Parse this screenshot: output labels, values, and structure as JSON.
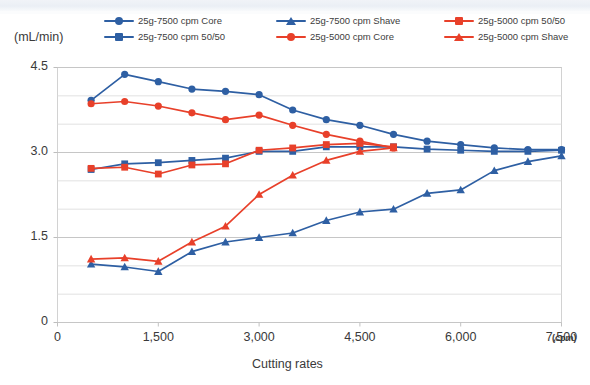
{
  "chart_data": {
    "type": "line",
    "title": "",
    "xlabel": "Cutting rates",
    "xunit": "(cpm)",
    "ylabel": "(mL/min)",
    "xlim": [
      0,
      7500
    ],
    "ylim": [
      0,
      4.5
    ],
    "xticks": [
      "0",
      "1,500",
      "3,000",
      "4,500",
      "6,000",
      "7,500"
    ],
    "xtick_values": [
      0,
      1500,
      3000,
      4500,
      6000,
      7500
    ],
    "yticks": [
      "0",
      "1.5",
      "3.0",
      "4.5"
    ],
    "ytick_values": [
      0,
      1.5,
      3.0,
      4.5
    ],
    "grid": true,
    "grid_minor_step": 0.5,
    "legend_position": "top",
    "colors": {
      "blue": "#2E5FA3",
      "red": "#E8402A",
      "grid": "#d8d8d8",
      "axis": "#c9c9c9"
    },
    "series": [
      {
        "name": "25g-7500 cpm Core",
        "color": "#2E5FA3",
        "marker": "circle",
        "x": [
          500,
          1000,
          1500,
          2000,
          2500,
          3000,
          3500,
          4000,
          4500,
          5000,
          5500,
          6000,
          6500,
          7000,
          7500
        ],
        "values": [
          3.92,
          4.38,
          4.25,
          4.12,
          4.08,
          4.02,
          3.75,
          3.58,
          3.48,
          3.32,
          3.2,
          3.14,
          3.08,
          3.05,
          3.05
        ]
      },
      {
        "name": "25g-7500 cpm 50/50",
        "color": "#2E5FA3",
        "marker": "square",
        "x": [
          500,
          1000,
          1500,
          2000,
          2500,
          3000,
          3500,
          4000,
          4500,
          5000,
          5500,
          6000,
          6500,
          7000,
          7500
        ],
        "values": [
          2.7,
          2.8,
          2.82,
          2.86,
          2.9,
          3.02,
          3.02,
          3.1,
          3.1,
          3.1,
          3.06,
          3.04,
          3.02,
          3.02,
          3.04
        ]
      },
      {
        "name": "25g-7500 cpm Shave",
        "color": "#2E5FA3",
        "marker": "triangle",
        "x": [
          500,
          1000,
          1500,
          2000,
          2500,
          3000,
          3500,
          4000,
          4500,
          5000,
          5500,
          6000,
          6500,
          7000,
          7500
        ],
        "values": [
          1.03,
          0.98,
          0.9,
          1.25,
          1.42,
          1.5,
          1.58,
          1.8,
          1.95,
          2.0,
          2.28,
          2.34,
          2.68,
          2.84,
          2.94
        ]
      },
      {
        "name": "25g-5000 cpm Core",
        "color": "#E8402A",
        "marker": "circle",
        "x": [
          500,
          1000,
          1500,
          2000,
          2500,
          3000,
          3500,
          4000,
          4500,
          5000
        ],
        "values": [
          3.86,
          3.9,
          3.82,
          3.7,
          3.58,
          3.66,
          3.48,
          3.32,
          3.2,
          3.08
        ]
      },
      {
        "name": "25g-5000 cpm 50/50",
        "color": "#E8402A",
        "marker": "square",
        "x": [
          500,
          1000,
          1500,
          2000,
          2500,
          3000,
          3500,
          4000,
          4500,
          5000
        ],
        "values": [
          2.72,
          2.74,
          2.62,
          2.78,
          2.8,
          3.04,
          3.08,
          3.14,
          3.16,
          3.1
        ]
      },
      {
        "name": "25g-5000 cpm Shave",
        "color": "#E8402A",
        "marker": "triangle",
        "x": [
          500,
          1000,
          1500,
          2000,
          2500,
          3000,
          3500,
          4000,
          4500,
          5000
        ],
        "values": [
          1.12,
          1.14,
          1.08,
          1.42,
          1.7,
          2.26,
          2.6,
          2.86,
          3.02,
          3.08
        ]
      }
    ]
  },
  "legend": {
    "rows": [
      [
        {
          "label": "25g-7500 cpm Core",
          "color": "#2E5FA3",
          "marker": "circle"
        },
        {
          "label": "25g-7500 cpm Shave",
          "color": "#2E5FA3",
          "marker": "triangle"
        },
        {
          "label": "25g-5000 cpm 50/50",
          "color": "#E8402A",
          "marker": "square"
        }
      ],
      [
        {
          "label": "25g-7500 cpm 50/50",
          "color": "#2E5FA3",
          "marker": "square"
        },
        {
          "label": "25g-5000 cpm Core",
          "color": "#E8402A",
          "marker": "circle"
        },
        {
          "label": "25g-5000 cpm Shave",
          "color": "#E8402A",
          "marker": "triangle"
        }
      ]
    ]
  }
}
